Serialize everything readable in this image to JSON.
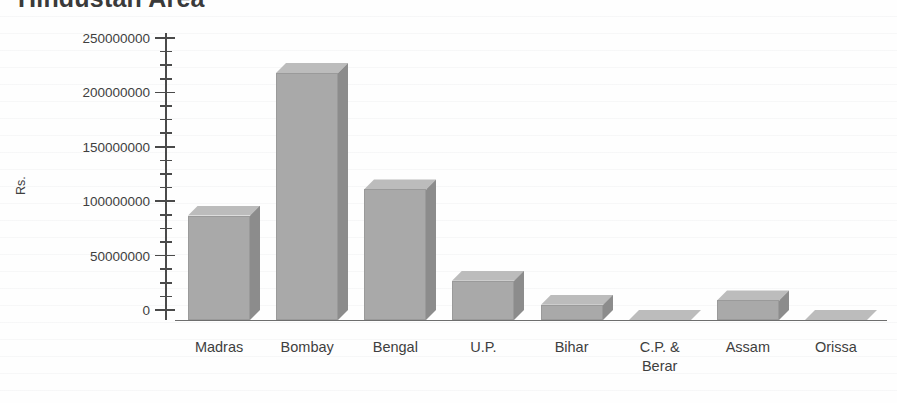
{
  "chart_data": {
    "type": "bar",
    "title": "Hindustan Area",
    "xlabel": "",
    "ylabel": "Rs.",
    "categories": [
      "Madras",
      "Bombay",
      "Bengal",
      "U.P.",
      "Bihar",
      "C.P. &\nBerar",
      "Assam",
      "Orissa"
    ],
    "values": [
      96000000,
      227000000,
      120000000,
      36000000,
      14000000,
      0,
      18000000,
      0
    ],
    "ylim": [
      0,
      250000000
    ],
    "ytick_values": [
      0,
      50000000,
      100000000,
      150000000,
      200000000,
      250000000
    ],
    "ytick_labels": [
      "0",
      "50000000",
      "100000000",
      "150000000",
      "200000000",
      "250000000"
    ],
    "minor_tick_step": 12500000,
    "grid": false,
    "legend": false,
    "style": "3d-bar",
    "colors": {
      "bar_front": "#a9a9a9",
      "bar_side": "#8c8c8c",
      "bar_top": "#bcbcbc",
      "axis": "#4a4a4a",
      "text": "#3f3f3f",
      "background": "#ffffff"
    }
  }
}
